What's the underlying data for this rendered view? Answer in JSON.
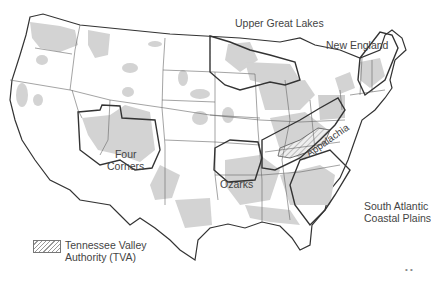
{
  "map": {
    "title": "",
    "regions": [
      {
        "name": "Upper Great Lakes",
        "label": "Upper Great Lakes"
      },
      {
        "name": "New England",
        "label": "New England"
      },
      {
        "name": "Four Corners",
        "label_line1": "Four",
        "label_line2": "Corners"
      },
      {
        "name": "Ozarks",
        "label": "Ozarks"
      },
      {
        "name": "Appalachia",
        "label": "Appalachia"
      },
      {
        "name": "South Atlantic Coastal Plains",
        "label_line1": "South Atlantic",
        "label_line2": "Coastal Plains"
      }
    ],
    "legend": {
      "line1": "Tennessee Valley",
      "line2": "Authority (TVA)"
    },
    "footer_mark": "• •",
    "colors": {
      "shading": "#d3d3d3",
      "state_border": "#555555",
      "region_border": "#333333"
    }
  }
}
